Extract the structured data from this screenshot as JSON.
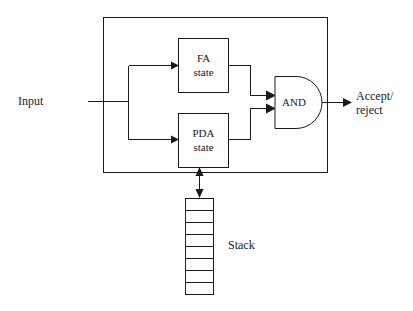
{
  "figure": {
    "kind": "block-diagram",
    "title_visible": false,
    "background_color": "#ffffff",
    "line_color": "#1a1a1a"
  },
  "labels": {
    "input": "Input",
    "fa_state_line1": "FA",
    "fa_state_line2": "state",
    "pda_state_line1": "PDA",
    "pda_state_line2": "state",
    "and_gate": "AND",
    "output_line1": "Accept/",
    "output_line2": "reject",
    "stack": "Stack"
  },
  "blocks": [
    {
      "name": "fa-state",
      "label": "FA state",
      "x": 178,
      "y": 38,
      "w": 50,
      "h": 54
    },
    {
      "name": "pda-state",
      "label": "PDA state",
      "x": 178,
      "y": 113,
      "w": 50,
      "h": 54
    },
    {
      "name": "and-gate",
      "label": "AND",
      "x": 274,
      "y": 76,
      "w": 44,
      "h": 52
    },
    {
      "name": "outer-machine-boundary",
      "label": "",
      "x": 103,
      "y": 17,
      "w": 224,
      "h": 155
    },
    {
      "name": "stack",
      "label": "Stack",
      "x": 185,
      "y": 198,
      "w": 28,
      "h": 96,
      "cells": 8
    }
  ],
  "connections": [
    {
      "name": "input-to-split",
      "from": "Input",
      "to": "branch point"
    },
    {
      "name": "split-to-fa",
      "from": "branch point",
      "to": "FA state"
    },
    {
      "name": "split-to-pda",
      "from": "branch point",
      "to": "PDA state"
    },
    {
      "name": "fa-to-and",
      "from": "FA state",
      "to": "AND"
    },
    {
      "name": "pda-to-and",
      "from": "PDA state",
      "to": "AND"
    },
    {
      "name": "and-to-output",
      "from": "AND",
      "to": "Accept/reject"
    },
    {
      "name": "pda-to-stack",
      "from": "PDA state",
      "to": "Stack",
      "bidirectional": true
    }
  ],
  "stack_cell_count": 8
}
